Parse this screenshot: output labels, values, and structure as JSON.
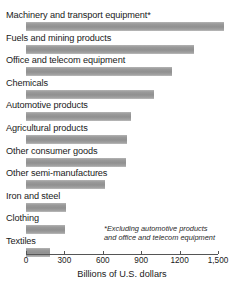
{
  "chart_data": {
    "type": "bar",
    "orientation": "horizontal",
    "title": "",
    "xlabel": "Billions of U.S. dollars",
    "ylabel": "",
    "xlim": [
      0,
      1500
    ],
    "grid": false,
    "legend": null,
    "tick_labels": [
      "0",
      "300",
      "600",
      "900",
      "1200",
      "1,500"
    ],
    "ticks": [
      0,
      300,
      600,
      900,
      1200,
      1500
    ],
    "categories": [
      "Machinery and transport equipment*",
      "Fuels and mining products",
      "Office and telecom equipment",
      "Chemicals",
      "Automotive products",
      "Agricultural products",
      "Other consumer goods",
      "Other semi-manufactures",
      "Iron and steel",
      "Clothing",
      "Textiles"
    ],
    "values": [
      1550,
      1310,
      1140,
      1000,
      820,
      790,
      780,
      620,
      310,
      305,
      190
    ],
    "annotations": [
      "*Excluding automotive products and office and telecom equipment"
    ],
    "footnote_line_1": "*Excluding automotive products",
    "footnote_line_2": "and office and telecom equipment",
    "bar_color": "#9a9a9a",
    "axis_color": "#555555",
    "text_color": "#1a1a1a"
  }
}
